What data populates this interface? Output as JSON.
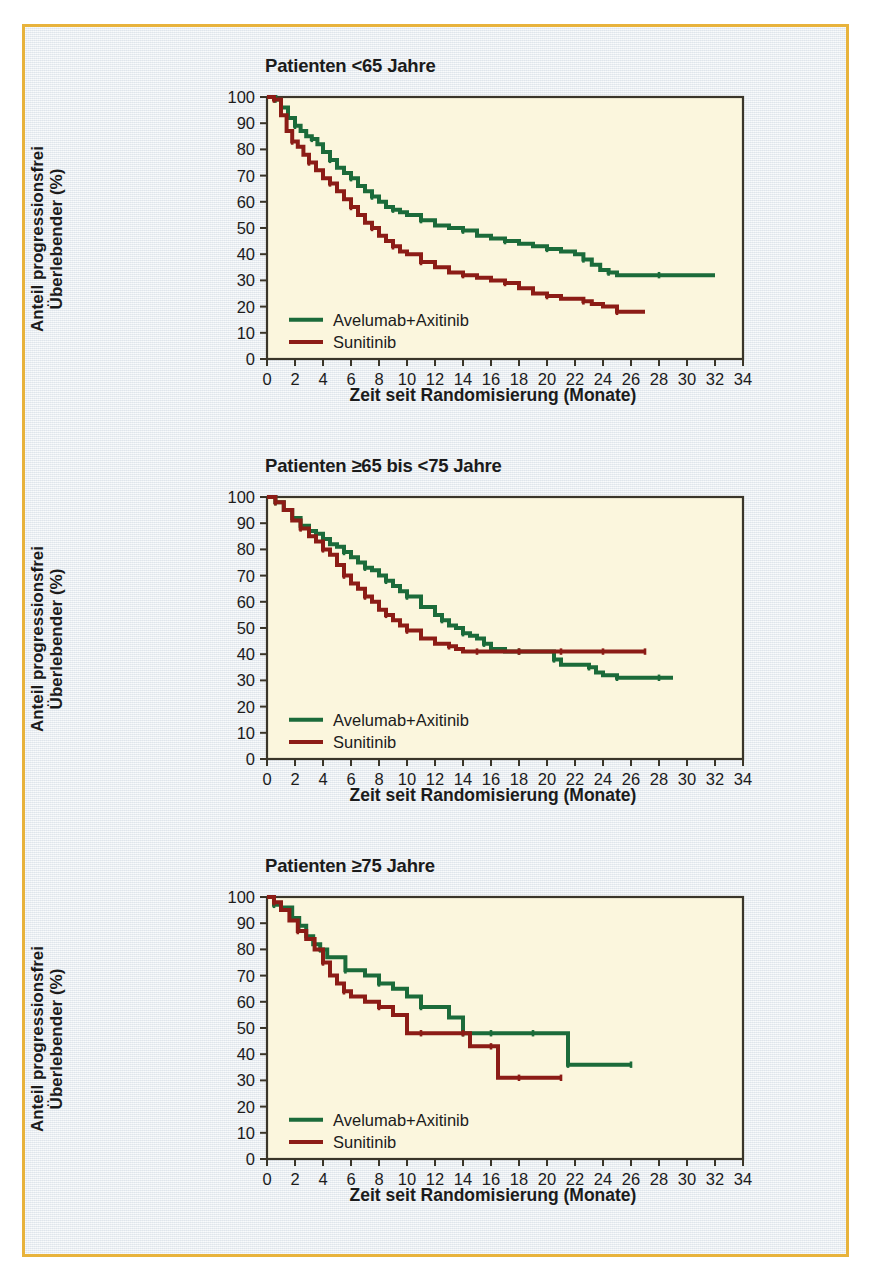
{
  "figure": {
    "frame_color": "#e8b33c",
    "background_color": "#e8ecf1",
    "plot_background_color": "#fbf6dd",
    "axis_color": "#3a3529"
  },
  "series_colors": {
    "avelumab_axitinib": "#1b6b3a",
    "sunitinib": "#8c1c16"
  },
  "legend": {
    "avelumab_axitinib": "Avelumab+Axitinib",
    "sunitinib": "Sunitinib"
  },
  "axes": {
    "xlabel": "Zeit seit Randomisierung (Monate)",
    "ylabel": "Anteil progressionsfrei\nÜberlebender (%)",
    "xticks": [
      0,
      2,
      4,
      6,
      8,
      10,
      12,
      14,
      16,
      18,
      20,
      22,
      24,
      26,
      28,
      30,
      32,
      34
    ],
    "yticks": [
      0,
      10,
      20,
      30,
      40,
      50,
      60,
      70,
      80,
      90,
      100
    ],
    "xlim": [
      0,
      34
    ],
    "ylim": [
      0,
      100
    ],
    "grid": false
  },
  "panels": [
    {
      "title": "Patienten <65 Jahre"
    },
    {
      "title": "Patienten ≥65 bis <75 Jahre"
    },
    {
      "title": "Patienten ≥75 Jahre"
    }
  ],
  "chart_data": [
    {
      "type": "line",
      "title": "Patienten <65 Jahre",
      "xlabel": "Zeit seit Randomisierung (Monate)",
      "ylabel": "Anteil progressionsfrei Überlebender (%)",
      "xlim": [
        0,
        34
      ],
      "ylim": [
        0,
        100
      ],
      "grid": false,
      "legend_position": "lower-left",
      "series": [
        {
          "name": "Avelumab+Axitinib",
          "color": "#1b6b3a",
          "x": [
            0,
            0.6,
            1.0,
            1.5,
            2.0,
            2.4,
            2.8,
            3.2,
            3.6,
            4.0,
            4.5,
            5.0,
            5.5,
            6.0,
            6.5,
            7.0,
            7.5,
            8.0,
            8.5,
            9.0,
            9.5,
            10.0,
            11.0,
            12.0,
            13.0,
            14.0,
            15.0,
            16.0,
            17.0,
            18.0,
            19.0,
            20.0,
            21.0,
            22.0,
            22.6,
            23.2,
            23.8,
            24.4,
            25.0,
            26.0,
            28.0,
            30.0,
            32.0
          ],
          "y": [
            100,
            99,
            96,
            92,
            89,
            87,
            85,
            84,
            82,
            79,
            76,
            73,
            71,
            69,
            66,
            64,
            62,
            60,
            58,
            57,
            56,
            55,
            53,
            51,
            50,
            49,
            47,
            46,
            45,
            44,
            43,
            42,
            41,
            40,
            38,
            36,
            34,
            33,
            32,
            32,
            32,
            32,
            32
          ]
        },
        {
          "name": "Sunitinib",
          "color": "#8c1c16",
          "x": [
            0,
            0.5,
            1.0,
            1.4,
            1.8,
            2.2,
            2.6,
            3.0,
            3.5,
            4.0,
            4.5,
            5.0,
            5.5,
            6.0,
            6.5,
            7.0,
            7.5,
            8.0,
            8.5,
            9.0,
            9.5,
            10.0,
            11.0,
            12.0,
            13.0,
            14.0,
            15.0,
            16.0,
            17.0,
            18.0,
            19.0,
            20.0,
            21.0,
            22.0,
            22.6,
            23.2,
            24.0,
            25.0,
            26.0,
            27.0
          ],
          "y": [
            100,
            99,
            93,
            87,
            83,
            81,
            78,
            75,
            72,
            69,
            67,
            64,
            61,
            58,
            55,
            52,
            50,
            47,
            45,
            43,
            41,
            40,
            37,
            35,
            33,
            32,
            31,
            30,
            29,
            27,
            25,
            24,
            23,
            23,
            22,
            21,
            20,
            18,
            18,
            18
          ]
        }
      ]
    },
    {
      "type": "line",
      "title": "Patienten ≥65 bis <75 Jahre",
      "xlabel": "Zeit seit Randomisierung (Monate)",
      "ylabel": "Anteil progressionsfrei Überlebender (%)",
      "xlim": [
        0,
        34
      ],
      "ylim": [
        0,
        100
      ],
      "grid": false,
      "legend_position": "lower-left",
      "series": [
        {
          "name": "Avelumab+Axitinib",
          "color": "#1b6b3a",
          "x": [
            0,
            0.6,
            1.2,
            1.8,
            2.4,
            3.0,
            3.5,
            4.0,
            4.5,
            5.0,
            5.5,
            6.0,
            6.5,
            7.0,
            7.5,
            8.0,
            8.5,
            9.0,
            9.5,
            10.0,
            11.0,
            12.0,
            12.5,
            13.0,
            13.5,
            14.0,
            14.5,
            15.0,
            15.5,
            16.0,
            17.0,
            18.0,
            19.0,
            20.0,
            20.5,
            21.0,
            22.0,
            23.0,
            23.5,
            24.0,
            25.0,
            26.0,
            27.0,
            28.0,
            29.0
          ],
          "y": [
            100,
            98,
            95,
            92,
            89,
            87,
            86,
            84,
            82,
            81,
            79,
            77,
            75,
            73,
            72,
            70,
            68,
            66,
            64,
            62,
            58,
            55,
            53,
            51,
            50,
            48,
            47,
            46,
            44,
            42,
            41,
            41,
            41,
            41,
            38,
            36,
            36,
            35,
            33,
            32,
            31,
            31,
            31,
            31,
            31
          ]
        },
        {
          "name": "Sunitinib",
          "color": "#8c1c16",
          "x": [
            0,
            0.6,
            1.2,
            1.8,
            2.4,
            3.0,
            3.5,
            4.0,
            4.5,
            5.0,
            5.5,
            6.0,
            6.5,
            7.0,
            7.5,
            8.0,
            8.5,
            9.0,
            9.5,
            10.0,
            11.0,
            12.0,
            13.0,
            13.5,
            14.0,
            15.0,
            16.0,
            17.0,
            18.0,
            19.0,
            20.0,
            21.0,
            22.0,
            23.0,
            24.0,
            25.0,
            26.0,
            27.0
          ],
          "y": [
            100,
            98,
            95,
            91,
            88,
            85,
            83,
            80,
            78,
            74,
            70,
            67,
            65,
            62,
            60,
            57,
            55,
            53,
            51,
            49,
            46,
            44,
            43,
            42,
            41,
            41,
            41,
            41,
            41,
            41,
            41,
            41,
            41,
            41,
            41,
            41,
            41,
            41
          ]
        }
      ]
    },
    {
      "type": "line",
      "title": "Patienten ≥75 Jahre",
      "xlabel": "Zeit seit Randomisierung (Monate)",
      "ylabel": "Anteil progressionsfrei Überlebender (%)",
      "xlim": [
        0,
        34
      ],
      "ylim": [
        0,
        100
      ],
      "grid": false,
      "legend_position": "lower-left",
      "series": [
        {
          "name": "Avelumab+Axitinib",
          "color": "#1b6b3a",
          "x": [
            0,
            0.5,
            1.0,
            1.8,
            2.3,
            2.8,
            3.3,
            3.8,
            4.3,
            5.0,
            5.6,
            6.2,
            7.0,
            8.0,
            9.0,
            10.0,
            11.0,
            12.0,
            13.0,
            14.0,
            14.5,
            15.0,
            16.0,
            17.0,
            18.0,
            19.0,
            20.0,
            21.0,
            21.5,
            22.0,
            24.0,
            26.0
          ],
          "y": [
            100,
            97,
            96,
            92,
            89,
            85,
            82,
            80,
            77,
            77,
            72,
            72,
            70,
            67,
            65,
            62,
            58,
            58,
            54,
            48,
            48,
            48,
            48,
            48,
            48,
            48,
            48,
            48,
            36,
            36,
            36,
            36
          ]
        },
        {
          "name": "Sunitinib",
          "color": "#8c1c16",
          "x": [
            0,
            0.5,
            1.0,
            1.6,
            2.2,
            2.8,
            3.4,
            4.0,
            4.5,
            5.0,
            5.5,
            6.0,
            7.0,
            8.0,
            9.0,
            10.0,
            11.0,
            12.0,
            13.0,
            14.0,
            14.5,
            15.0,
            16.0,
            16.5,
            17.0,
            18.0,
            19.0,
            20.0,
            21.0
          ],
          "y": [
            100,
            98,
            95,
            91,
            87,
            84,
            80,
            75,
            70,
            67,
            64,
            62,
            60,
            58,
            55,
            48,
            48,
            48,
            48,
            48,
            43,
            43,
            43,
            31,
            31,
            31,
            31,
            31,
            31
          ]
        }
      ]
    }
  ]
}
